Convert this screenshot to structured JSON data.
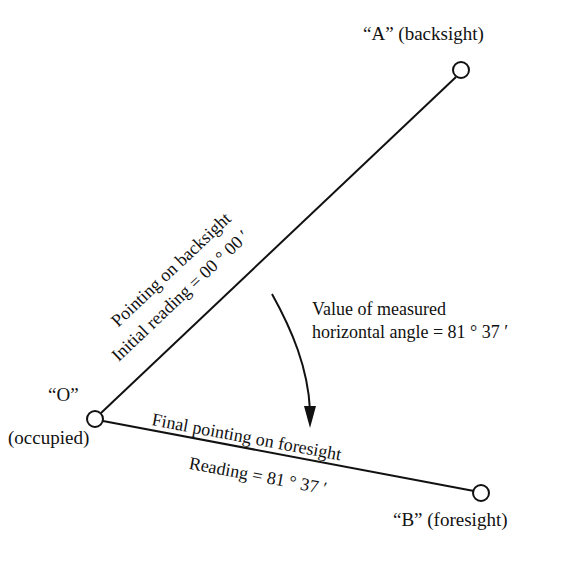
{
  "diagram": {
    "stroke_color": "#111111",
    "background_color": "#ffffff",
    "nodes": {
      "a": {
        "label": "“A” (backsight)",
        "x": 461,
        "y": 70,
        "radius": 8
      },
      "o": {
        "label": "“O”",
        "sublabel": "(occupied)",
        "x": 95,
        "y": 419,
        "radius": 8
      },
      "b": {
        "label": "“B” (foresight)",
        "x": 481,
        "y": 493,
        "radius": 8
      }
    },
    "rays": {
      "backsight": {
        "label_above": "Pointing on backsight",
        "label_below": "Initial reading = 00 ° 00 ′",
        "angle_deg": -43.4
      },
      "foresight": {
        "label_above": "Final pointing on foresight",
        "label_below": "Reading = 81 ° 37 ′",
        "angle_deg": 10.6
      }
    },
    "callout": {
      "line1": "Value of measured",
      "line2": "horizontal angle = 81 ° 37 ′"
    },
    "arrow": {
      "name": "curved-arrow",
      "from_x": 272,
      "from_y": 294,
      "to_x": 310,
      "to_y": 426
    }
  }
}
